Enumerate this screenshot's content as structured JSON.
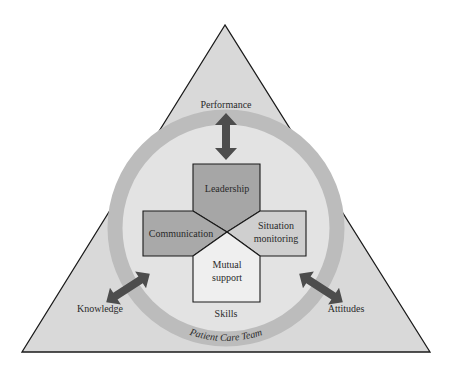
{
  "diagram": {
    "title": "Patient Care Team",
    "outcomes": {
      "top": "Performance",
      "left": "Knowledge",
      "right": "Attitudes"
    },
    "skills_label": "Skills",
    "ring_label": "Patient Care Team",
    "quadrants": {
      "top": "Leadership",
      "left": "Communication",
      "right_line1": "Situation",
      "right_line2": "monitoring",
      "bottom_line1": "Mutual",
      "bottom_line2": "support"
    },
    "colors": {
      "triangle_fill": "#d9d9d9",
      "ring": "#bdbdbd",
      "inner": "#e4e4e4",
      "leadership": "#a6a6a6",
      "communication": "#a9a9a9",
      "situation": "#cfcfcf",
      "mutual": "#efefef",
      "arrow": "#4d4d4d",
      "stroke": "#1a1a1a"
    }
  }
}
